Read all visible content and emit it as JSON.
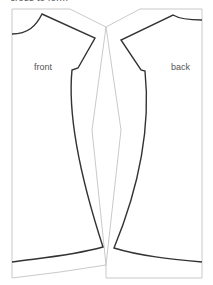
{
  "caption": "cross to form",
  "labels": {
    "front": "front",
    "back": "back"
  },
  "colors": {
    "outline": "#333333",
    "frame": "#bbbbbb",
    "text": "#555555",
    "background": "#ffffff"
  }
}
